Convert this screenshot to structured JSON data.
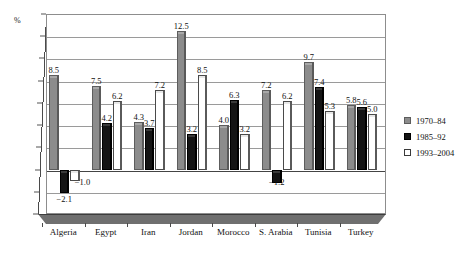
{
  "chart_data": {
    "type": "bar",
    "title": "",
    "subtitle": "",
    "xlabel": "",
    "ylabel": "%",
    "unit_label": "%",
    "ylim": [
      -4,
      14
    ],
    "ytick_step": 2,
    "yticks": [
      "14",
      "12",
      "10",
      "8",
      "6",
      "4",
      "2",
      "0",
      "-2",
      "-4"
    ],
    "ytick_values": [
      14,
      12,
      10,
      8,
      6,
      4,
      2,
      0,
      -2,
      -4
    ],
    "grid": true,
    "legend_position": "right",
    "categories": [
      "Algeria",
      "Egypt",
      "Iran",
      "Jordan",
      "Morocco",
      "S. Arabia",
      "Tunisia",
      "Turkey"
    ],
    "series": [
      {
        "name": "1970-84",
        "label": "1970–84",
        "color": "#8c8c8c",
        "values": [
          8.5,
          7.5,
          4.3,
          12.5,
          4.0,
          7.2,
          9.7,
          5.8
        ],
        "value_labels": [
          "8.5",
          "7.5",
          "4.3",
          "12.5",
          "4.0",
          "7.2",
          "9.7",
          "5.8"
        ]
      },
      {
        "name": "1985-92",
        "label": "1985–92",
        "color": "#141414",
        "values": [
          -2.1,
          4.2,
          3.7,
          3.2,
          6.3,
          -1.2,
          7.4,
          5.6
        ],
        "value_labels": [
          "−2.1",
          "4.2",
          "3.7",
          "3.2",
          "6.3",
          "−1.2",
          "7.4",
          "5.6"
        ]
      },
      {
        "name": "1993-2004",
        "label": "1993–2004",
        "color": "#ffffff",
        "values": [
          -1.0,
          6.2,
          7.2,
          8.5,
          3.2,
          6.2,
          5.3,
          5.0
        ],
        "value_labels": [
          "−1.0",
          "6.2",
          "7.2",
          "8.5",
          "3.2",
          "6.2",
          "5.3",
          "5.0"
        ]
      }
    ]
  },
  "legend": {
    "items": [
      {
        "label": "1970–84",
        "swatch": "s0"
      },
      {
        "label": "1985–92",
        "swatch": "s1"
      },
      {
        "label": "1993–2004",
        "swatch": "s2"
      }
    ]
  }
}
